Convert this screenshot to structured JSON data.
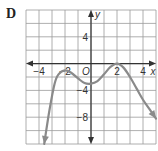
{
  "panel": {
    "label": "D"
  },
  "chart_data": {
    "type": "line",
    "title": "",
    "xlabel": "x",
    "ylabel": "y",
    "origin_label": "O",
    "xlim": [
      -5,
      5
    ],
    "ylim": [
      -12,
      8
    ],
    "grid": true,
    "x_ticks": [
      {
        "value": -4,
        "label": "−4"
      },
      {
        "value": -2,
        "label": "−2"
      },
      {
        "value": 2,
        "label": "2"
      },
      {
        "value": 4,
        "label": "4"
      }
    ],
    "y_ticks": [
      {
        "value": 4,
        "label": "4"
      },
      {
        "value": -4,
        "label": "−4"
      },
      {
        "value": -8,
        "label": "−8"
      }
    ],
    "series": [
      {
        "name": "f(x)",
        "color": "#8a8a8a",
        "x": [
          -3.6,
          -3.2,
          -2.8,
          -2.5,
          -2.0,
          -1.5,
          -1.0,
          -0.5,
          0.0,
          0.5,
          1.0,
          1.5,
          2.0,
          2.5,
          3.0,
          3.5,
          4.0,
          4.5,
          5.0
        ],
        "y": [
          -12.0,
          -7.0,
          -3.0,
          -1.6,
          -1.0,
          -1.4,
          -2.2,
          -2.9,
          -3.0,
          -2.6,
          -1.6,
          -0.5,
          0.0,
          -0.6,
          -2.0,
          -3.7,
          -5.4,
          -6.8,
          -8.2
        ],
        "end_arrows": true
      }
    ],
    "key_points": {
      "local_max_1": [
        -2,
        -1
      ],
      "local_min": [
        0,
        -3
      ],
      "local_max_2": [
        2,
        0
      ]
    }
  }
}
